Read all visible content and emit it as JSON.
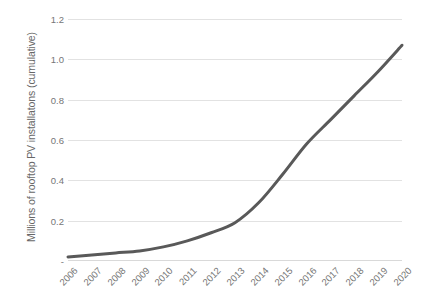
{
  "chart_data": {
    "type": "line",
    "title": "",
    "xlabel": "",
    "ylabel": "Millions of rooftop PV installatons (cumulative)",
    "categories": [
      "2006",
      "2007",
      "2008",
      "2009",
      "2010",
      "2011",
      "2012",
      "2013",
      "2014",
      "2015",
      "2016",
      "2017",
      "2018",
      "2019",
      "2020"
    ],
    "values": [
      0.02,
      0.03,
      0.04,
      0.05,
      0.07,
      0.1,
      0.14,
      0.19,
      0.29,
      0.43,
      0.58,
      0.7,
      0.82,
      0.94,
      1.07
    ],
    "series": [
      {
        "name": "Cumulative rooftop PV installations",
        "values": [
          0.02,
          0.03,
          0.04,
          0.05,
          0.07,
          0.1,
          0.14,
          0.19,
          0.29,
          0.43,
          0.58,
          0.7,
          0.82,
          0.94,
          1.07
        ]
      }
    ],
    "ylim": [
      0,
      1.2
    ],
    "y_ticks": [
      0,
      0.2,
      0.4,
      0.6,
      0.8,
      1.0,
      1.2
    ],
    "y_tick_labels": [
      "-",
      "0.2",
      "0.4",
      "0.6",
      "0.8",
      "1.0",
      "1.2"
    ],
    "grid": true,
    "grid_axis": "y",
    "legend": "none",
    "line_color": "#595959",
    "line_width": 3,
    "markers": false,
    "smooth": true,
    "gridline_color": "#e2e2e2",
    "tick_label_color": "#767676",
    "axis_title_color": "#676767",
    "background": "#ffffff"
  }
}
